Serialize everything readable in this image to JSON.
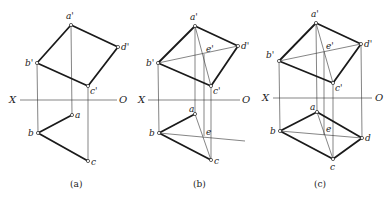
{
  "panels": [
    {
      "id": "a",
      "caption": "(a)",
      "axis": {
        "x_label": "X",
        "o_label": "O"
      },
      "labels": {
        "a_prime": "a'",
        "b_prime": "b'",
        "c_prime": "c'",
        "d_prime": "d'",
        "a": "a",
        "b": "b",
        "c": "c"
      }
    },
    {
      "id": "b",
      "caption": "(b)",
      "axis": {
        "x_label": "X",
        "o_label": "O"
      },
      "labels": {
        "a_prime": "a'",
        "b_prime": "b'",
        "c_prime": "c'",
        "d_prime": "d'",
        "e_prime": "e'",
        "a": "a",
        "b": "b",
        "c": "c",
        "e": "e"
      }
    },
    {
      "id": "c",
      "caption": "(c)",
      "axis": {
        "x_label": "X",
        "o_label": "O"
      },
      "labels": {
        "a_prime": "a'",
        "b_prime": "b'",
        "c_prime": "c'",
        "d_prime": "d'",
        "e_prime": "e'",
        "a": "a",
        "b": "b",
        "c": "c",
        "d": "d",
        "e": "e"
      }
    }
  ],
  "colors": {
    "line": "#1a1a1a",
    "background": "#ffffff"
  }
}
